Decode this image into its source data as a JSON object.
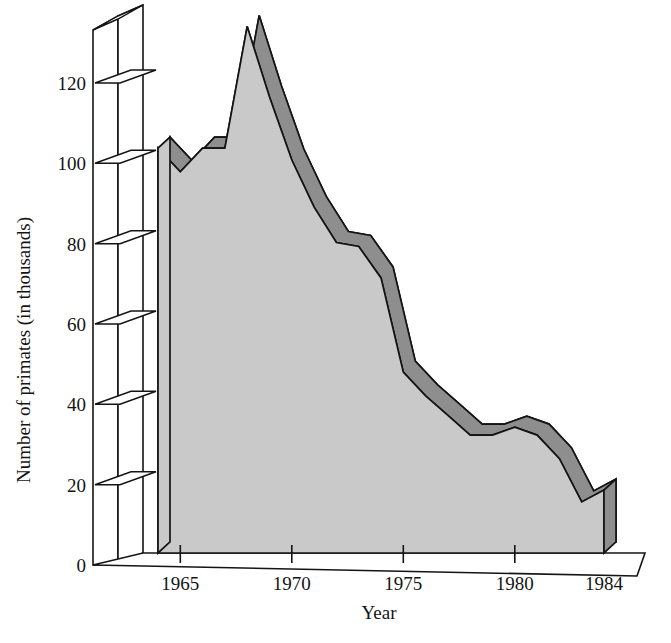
{
  "chart_data": {
    "type": "area",
    "title": "",
    "subtitle": "",
    "xlabel": "Year",
    "ylabel": "Number of primates (in thousands)",
    "xlim": [
      1964,
      1984
    ],
    "ylim": [
      0,
      135
    ],
    "grid": false,
    "legend": null,
    "style": "3d-ribbon-area",
    "x_tick_labels": [
      "1965",
      "1970",
      "1975",
      "1980",
      "1984"
    ],
    "x_tick_values": [
      1965,
      1970,
      1975,
      1980,
      1984
    ],
    "y_tick_labels": [
      "0",
      "20",
      "40",
      "60",
      "80",
      "100",
      "120"
    ],
    "y_tick_values": [
      0,
      20,
      40,
      60,
      80,
      100,
      120
    ],
    "x": [
      1964,
      1965,
      1966,
      1967,
      1968,
      1969,
      1970,
      1971,
      1972,
      1973,
      1974,
      1975,
      1976,
      1977,
      1978,
      1979,
      1980,
      1981,
      1982,
      1983,
      1984
    ],
    "values": [
      103,
      97,
      103,
      103,
      134,
      116,
      100,
      88,
      79,
      78,
      70,
      46,
      40,
      35,
      30,
      30,
      32,
      30,
      24,
      13,
      16
    ],
    "series": [
      {
        "name": "Number of primates (in thousands)",
        "values": [
          103,
          97,
          103,
          103,
          134,
          116,
          100,
          88,
          79,
          78,
          70,
          46,
          40,
          35,
          30,
          30,
          32,
          30,
          24,
          13,
          16
        ]
      }
    ],
    "annotations": [],
    "colors": {
      "area_front": "#c9c9c9",
      "ribbon_top": "#8e8e8e",
      "outline": "#141414",
      "background": "#ffffff",
      "axis": "#141414"
    }
  },
  "axes": {
    "y_axis_label": "Number of primates (in thousands)",
    "x_axis_label": "Year",
    "y_ticks": [
      {
        "label": "120",
        "value": 120
      },
      {
        "label": "100",
        "value": 100
      },
      {
        "label": "80",
        "value": 80
      },
      {
        "label": "60",
        "value": 60
      },
      {
        "label": "40",
        "value": 40
      },
      {
        "label": "20",
        "value": 20
      },
      {
        "label": "0",
        "value": 0
      }
    ],
    "x_ticks": [
      {
        "label": "1965",
        "value": 1965
      },
      {
        "label": "1970",
        "value": 1970
      },
      {
        "label": "1975",
        "value": 1975
      },
      {
        "label": "1980",
        "value": 1980
      },
      {
        "label": "1984",
        "value": 1984
      }
    ]
  }
}
